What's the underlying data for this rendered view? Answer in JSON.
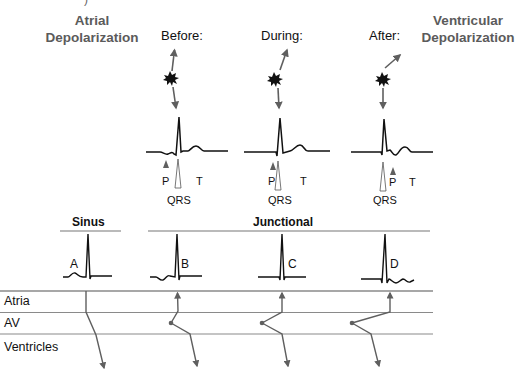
{
  "header": {
    "left_title": "Atrial Depolarization",
    "left_title_line1": "Atrial",
    "left_title_line2": "Depolarization",
    "right_title_line1": "Ventricular",
    "right_title_line2": "Depolarization",
    "top_fragment": ")"
  },
  "phases": [
    {
      "label": "Before:",
      "p": "P",
      "qrs": "QRS",
      "t": "T"
    },
    {
      "label": "During:",
      "p": "P",
      "qrs": "QRS",
      "t": "T"
    },
    {
      "label": "After:",
      "p": "P",
      "qrs": "QRS",
      "t": "T"
    }
  ],
  "sections": {
    "sinus": "Sinus",
    "junctional": "Junctional"
  },
  "traces": [
    {
      "label": "A"
    },
    {
      "label": "B"
    },
    {
      "label": "C"
    },
    {
      "label": "D"
    }
  ],
  "lanes": [
    {
      "label": "Atria"
    },
    {
      "label": "AV"
    },
    {
      "label": "Ventricles"
    }
  ],
  "colors": {
    "arrow": "#5f5f5f",
    "trace": "#111111",
    "lane_line": "#8a8a8a",
    "header_gray": "#5b5b5b"
  }
}
